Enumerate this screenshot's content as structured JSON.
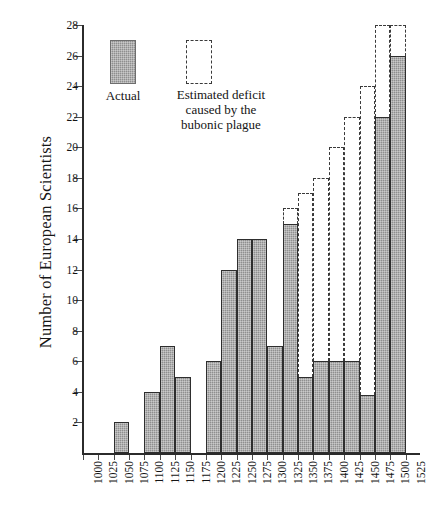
{
  "chart_data": {
    "type": "bar",
    "title": "",
    "xlabel": "",
    "ylabel": "Number of European Scientists",
    "ylim": [
      0,
      28
    ],
    "ytick_step": 2,
    "grid": false,
    "legend_position": "inside-upper-left",
    "categories": [
      "1000",
      "1025",
      "1050",
      "1075",
      "1100",
      "1125",
      "1150",
      "1175",
      "1200",
      "1225",
      "1250",
      "1275",
      "1300",
      "1325",
      "1350",
      "1375",
      "1400",
      "1425",
      "1450",
      "1475",
      "1500",
      "1525"
    ],
    "xtick_labels": [
      "1000",
      "1025",
      "1050",
      "1075",
      "1100",
      "1125",
      "1150",
      "1175",
      "1200",
      "1225",
      "1250",
      "1275",
      "1300",
      "1325",
      "1350",
      "1375",
      "1400",
      "1425",
      "1450",
      "1475",
      "1500",
      "1525"
    ],
    "ytick_labels": [
      "2",
      "4",
      "6",
      "8",
      "10",
      "12",
      "14",
      "16",
      "18",
      "20",
      "22",
      "24",
      "26",
      "28"
    ],
    "ytick_values": [
      2,
      4,
      6,
      8,
      10,
      12,
      14,
      16,
      18,
      20,
      22,
      24,
      26,
      28
    ],
    "series": [
      {
        "name": "Actual",
        "style": "filled",
        "values": [
          0,
          0,
          2,
          0,
          4,
          7,
          5,
          0,
          6,
          12,
          14,
          14,
          7,
          15,
          5,
          6,
          6,
          6,
          3.8,
          22,
          26,
          0
        ]
      },
      {
        "name": "Estimated deficit caused by the bubonic plague",
        "style": "dashed-outline",
        "values": [
          null,
          null,
          null,
          null,
          null,
          null,
          null,
          null,
          null,
          null,
          null,
          null,
          null,
          16,
          17,
          18,
          20,
          22,
          24,
          28,
          28,
          null
        ]
      }
    ]
  },
  "legend": {
    "actual_label": "Actual",
    "estimate_label_line1": "Estimated deficit",
    "estimate_label_line2": "caused by the",
    "estimate_label_line3": "bubonic plague",
    "actual_swatch_color": "#8f8f8f",
    "estimate_swatch_color": "#3a3a3a"
  },
  "axes": {
    "y_title": "Number of European Scientists"
  }
}
